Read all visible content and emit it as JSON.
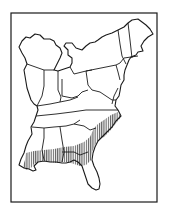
{
  "figure": {
    "type": "range-map",
    "region": "Eastern United States",
    "frame": {
      "x": 11,
      "y": 13,
      "width": 146,
      "height": 189
    },
    "colors": {
      "background": "#ffffff",
      "stroke": "#1a1a1a",
      "hatch": "#222222"
    },
    "legend": [],
    "labels": [],
    "highlighted_region": {
      "description": "Vertically hatched area along the southeastern Atlantic and Gulf coastal plain",
      "pattern": "vertical-hatch"
    }
  }
}
